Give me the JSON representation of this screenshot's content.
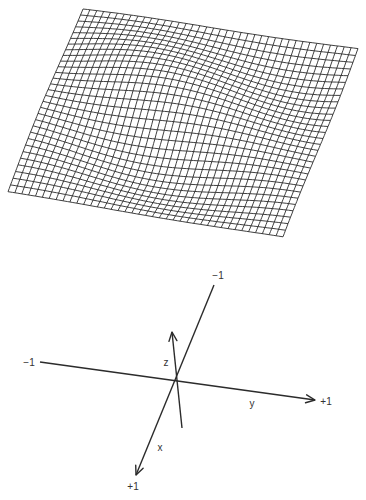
{
  "figure": {
    "mesh": {
      "description": "wireframe surface plot",
      "stroke_color": "#2a2a2a",
      "columns": 40,
      "rows": 30,
      "corners": {
        "top_left": [
          83,
          9
        ],
        "top_right": [
          358,
          48
        ],
        "bottom_right": [
          283,
          237
        ],
        "bottom_left": [
          8,
          192
        ]
      },
      "amplitude": 14
    },
    "axes": {
      "color": "#2b2b2b",
      "origin": [
        176,
        380
      ],
      "y_axis": {
        "start": [
          40,
          362
        ],
        "end": [
          315,
          400
        ],
        "label": "y",
        "neg_label": "−1",
        "pos_label": "+1"
      },
      "x_axis": {
        "start": [
          214,
          285
        ],
        "end": [
          136,
          475
        ],
        "label": "x",
        "neg_label": "−1",
        "pos_label": "+1"
      },
      "z_axis": {
        "start": [
          182,
          428
        ],
        "end": [
          172,
          332
        ],
        "label": "z"
      }
    },
    "labels": {
      "y_neg": {
        "text": "−1",
        "pos": [
          29,
          363
        ]
      },
      "y_pos": {
        "text": "+1",
        "pos": [
          326,
          402
        ]
      },
      "y_name": {
        "text": "y",
        "pos": [
          252,
          404
        ]
      },
      "x_neg": {
        "text": "−1",
        "pos": [
          218,
          276
        ]
      },
      "x_pos": {
        "text": "+1",
        "pos": [
          133,
          487
        ]
      },
      "x_name": {
        "text": "x",
        "pos": [
          160,
          448
        ]
      },
      "z_name": {
        "text": "z",
        "pos": [
          166,
          363
        ]
      }
    }
  }
}
